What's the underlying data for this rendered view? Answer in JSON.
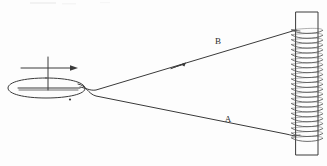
{
  "figure": {
    "background_color": "#fdfdfd",
    "ink_color": "#3a3a3a",
    "labels": {
      "upper_wire": "B",
      "lower_wire": "A"
    },
    "upper_wire_label_position": {
      "x": 218,
      "y": 44
    },
    "lower_wire_label_position": {
      "x": 228,
      "y": 122
    },
    "left_device": {
      "name": "oval-loop-with-pointer",
      "ellipse_center": {
        "x": 45,
        "y": 88
      },
      "ellipse_radius_x": 38,
      "ellipse_radius_y": 10,
      "inner_bar_y": 88,
      "pointer_arrow_direction": "right",
      "pivot_dot": {
        "x": 70,
        "y": 99
      }
    },
    "right_device": {
      "name": "solenoid-on-iron-bar",
      "bar_left": 296,
      "bar_right": 318,
      "bar_top": 12,
      "bar_bottom": 155,
      "coil_turns": 23,
      "coil_top": 30,
      "coil_bottom": 138
    },
    "wires": {
      "upper": {
        "label": "B",
        "from": {
          "x": 92,
          "y": 92
        },
        "to": {
          "x": 296,
          "y": 30
        },
        "arrow_at": {
          "x": 178,
          "y": 66
        },
        "arrow_direction": "toward-left-device"
      },
      "lower": {
        "label": "A",
        "from": {
          "x": 88,
          "y": 86
        },
        "to": {
          "x": 296,
          "y": 136
        }
      }
    }
  }
}
